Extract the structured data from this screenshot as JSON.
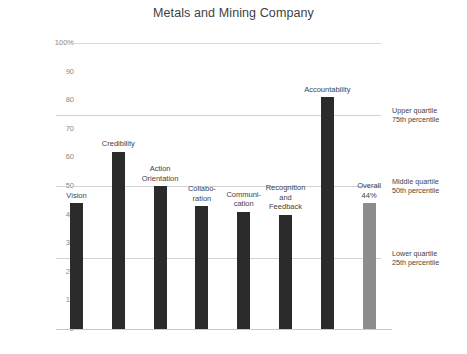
{
  "chart_data": {
    "type": "bar",
    "title": "Metals and Mining Company",
    "xlabel": "",
    "ylabel": "",
    "ylim": [
      0,
      100
    ],
    "grid": true,
    "legend_position": "right",
    "categories": [
      "Vision",
      "Credibility",
      "Action\nOrientation",
      "Collabo-\nration",
      "Communi-\ncation",
      "Recognition\nand\nFeedback",
      "Accountability",
      "Overall"
    ],
    "values": [
      44,
      62,
      50,
      43,
      41,
      40,
      81,
      44
    ],
    "value_labels": [
      "",
      "",
      "",
      "",
      "",
      "",
      "",
      "44%"
    ],
    "bar_colors": [
      "#2b2b2b",
      "#2b2b2b",
      "#2b2b2b",
      "#2b2b2b",
      "#2b2b2b",
      "#2b2b2b",
      "#2b2b2b",
      "#8c8c8c"
    ],
    "y_ticks": [
      "100%",
      "90",
      "80",
      "70",
      "60",
      "50",
      "40",
      "30",
      "20",
      "10",
      "0"
    ],
    "y_tick_values": [
      100,
      90,
      80,
      70,
      60,
      50,
      40,
      30,
      20,
      10,
      0
    ],
    "reference_lines": [
      {
        "value": 75,
        "label_top": "Upper quartile",
        "label_bottom": "75th percentile"
      },
      {
        "value": 50,
        "label_top": "Middle quartile",
        "label_bottom": "50th percentile"
      },
      {
        "value": 25,
        "label_top": "Lower quartile",
        "label_bottom": "25th percentile"
      }
    ],
    "colors": {
      "bar": "#2b2b2b",
      "overall_bar": "#8c8c8c",
      "gridline": "#d9d9d9",
      "axis_text": "#8a8a8a",
      "label_text": "#3f3f3f"
    }
  }
}
